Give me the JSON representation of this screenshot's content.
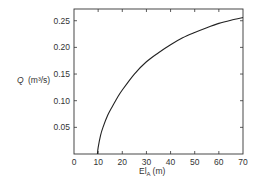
{
  "chart_data": {
    "type": "line",
    "title": "",
    "xlabel": "El",
    "xlabel_subscript": "A",
    "xlabel_unit": "(m)",
    "ylabel": "Q",
    "ylabel_unit": "(m³/s)",
    "xlim": [
      0,
      70
    ],
    "ylim": [
      0,
      0.272
    ],
    "grid": false,
    "legend": null,
    "x_ticks": [
      0,
      10,
      20,
      30,
      40,
      50,
      60,
      70
    ],
    "x_tick_labels": [
      "0",
      "10",
      "20",
      "30",
      "40",
      "50",
      "60",
      "70"
    ],
    "y_ticks": [
      0.05,
      0.1,
      0.15,
      0.2,
      0.25
    ],
    "y_tick_labels": [
      "0.05",
      "0.10",
      "0.15",
      "0.20",
      "0.25"
    ],
    "series": [
      {
        "name": "Q vs El_A",
        "x": [
          9.7,
          10,
          11,
          12,
          14,
          16,
          18,
          20,
          25,
          30,
          35,
          40,
          45,
          50,
          55,
          60,
          65,
          70
        ],
        "y": [
          0.0,
          0.012,
          0.035,
          0.05,
          0.073,
          0.09,
          0.106,
          0.12,
          0.15,
          0.173,
          0.19,
          0.205,
          0.218,
          0.228,
          0.237,
          0.245,
          0.251,
          0.256
        ]
      }
    ]
  }
}
